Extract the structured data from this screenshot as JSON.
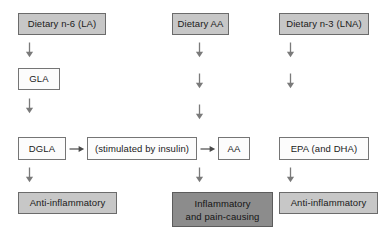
{
  "diagram": {
    "type": "flowchart",
    "background_color": "#ffffff",
    "colors": {
      "gray_fill": "#c7c7c7",
      "dark_gray_fill": "#8c8c8c",
      "white_fill": "#fcfcfc",
      "border": "#6e6e6e",
      "arrow": "#7a7a7a",
      "text": "#1a1a1a"
    },
    "columns": [
      {
        "id": "n6",
        "label": "n-6 pathway"
      },
      {
        "id": "aa",
        "label": "arachidonic acid pathway"
      },
      {
        "id": "n3",
        "label": "n-3 pathway"
      }
    ],
    "nodes": {
      "dietary_n6": "Dietary n-6 (LA)",
      "dietary_aa": "Dietary AA",
      "dietary_n3": "Dietary n-3 (LNA)",
      "gla": "GLA",
      "dgla": "DGLA",
      "stimulated_by_insulin": "(stimulated by insulin)",
      "aa": "AA",
      "epa": "EPA (and DHA)",
      "anti_inflammatory_left": "Anti-inflammatory",
      "inflammatory": "Inflammatory\nand pain-causing",
      "anti_inflammatory_right": "Anti-inflammatory"
    },
    "arrows": {
      "down_glyph": "↓",
      "right_glyph": "→",
      "down_count": 12,
      "right_count": 2
    }
  }
}
